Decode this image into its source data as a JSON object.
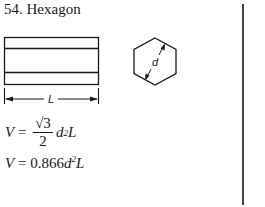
{
  "title": "54.  Hexagon",
  "figure": {
    "length_label": "L",
    "diameter_label": "d"
  },
  "equations": {
    "eq1_lhs": "V",
    "eq1_eq": " = ",
    "eq1_num": "√3",
    "eq1_den": "2",
    "eq1_var": "d",
    "eq1_exp": "2",
    "eq1_tail": "L",
    "eq2_lhs": "V",
    "eq2_eq": " = ",
    "eq2_coef": "0.866",
    "eq2_var": "d",
    "eq2_exp": "2",
    "eq2_tail": "L"
  }
}
